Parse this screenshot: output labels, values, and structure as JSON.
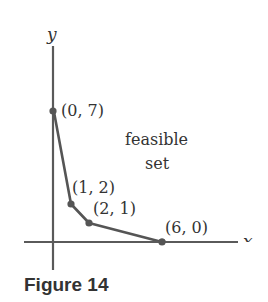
{
  "figure": {
    "caption": "Figure 14",
    "axis_x_label": "x",
    "axis_y_label": "y",
    "region_label_line1": "feasible",
    "region_label_line2": "set",
    "points": [
      {
        "label": "(0, 7)",
        "x": 0,
        "y": 7
      },
      {
        "label": "(1, 2)",
        "x": 1,
        "y": 2
      },
      {
        "label": "(2, 1)",
        "x": 2,
        "y": 1
      },
      {
        "label": "(6, 0)",
        "x": 6,
        "y": 0
      }
    ],
    "colors": {
      "axis": "#555555",
      "boundary": "#555555",
      "text": "#333333"
    }
  }
}
